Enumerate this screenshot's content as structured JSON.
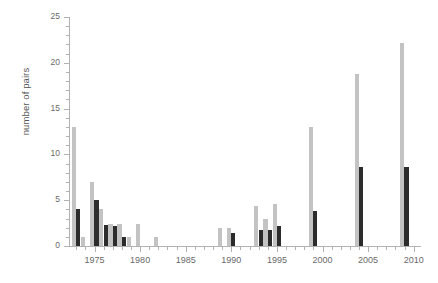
{
  "chart_data": {
    "type": "bar",
    "title": "",
    "subtitle": "",
    "xlabel": "",
    "ylabel": "number of pairs",
    "xlim": [
      1972.2,
      2010.8
    ],
    "ylim": [
      0,
      25
    ],
    "yticks": [
      0,
      5,
      10,
      15,
      20,
      25
    ],
    "ytick_labels": [
      "0",
      "5",
      "10",
      "15",
      "20",
      "25"
    ],
    "y_minor_tick_step": 1,
    "xticks": [
      1975,
      1980,
      1985,
      1990,
      1995,
      2000,
      2005,
      2010
    ],
    "xtick_labels": [
      "1975",
      "1980",
      "1985",
      "1990",
      "1995",
      "2000",
      "2005",
      "2010"
    ],
    "x_minor_tick_step": 1,
    "grid": false,
    "legend": "none",
    "colors": {
      "series_light": "#c3c3c3",
      "series_dark": "#2c2c2c",
      "axis": "#b2b2b2",
      "text": "#6a6a6a",
      "background": "#ffffff"
    },
    "series": [
      {
        "name": "light",
        "color": "#c3c3c3",
        "points": [
          {
            "x": 1973,
            "y": 13
          },
          {
            "x": 1974,
            "y": 1
          },
          {
            "x": 1975,
            "y": 7
          },
          {
            "x": 1976,
            "y": 4
          },
          {
            "x": 1977,
            "y": 2.4
          },
          {
            "x": 1978,
            "y": 2.4
          },
          {
            "x": 1979,
            "y": 1
          },
          {
            "x": 1980,
            "y": 2.4
          },
          {
            "x": 1982,
            "y": 1
          },
          {
            "x": 1989,
            "y": 2
          },
          {
            "x": 1990,
            "y": 2
          },
          {
            "x": 1993,
            "y": 4.4
          },
          {
            "x": 1994,
            "y": 3
          },
          {
            "x": 1995,
            "y": 4.6
          },
          {
            "x": 1999,
            "y": 13
          },
          {
            "x": 2004,
            "y": 18.8
          },
          {
            "x": 2009,
            "y": 22.2
          }
        ]
      },
      {
        "name": "dark",
        "color": "#2c2c2c",
        "points": [
          {
            "x": 1973,
            "y": 4
          },
          {
            "x": 1975,
            "y": 5
          },
          {
            "x": 1976,
            "y": 2.3
          },
          {
            "x": 1977,
            "y": 2.2
          },
          {
            "x": 1978,
            "y": 1
          },
          {
            "x": 1990,
            "y": 1.4
          },
          {
            "x": 1993,
            "y": 1.8
          },
          {
            "x": 1994,
            "y": 1.8
          },
          {
            "x": 1995,
            "y": 2.2
          },
          {
            "x": 1999,
            "y": 3.8
          },
          {
            "x": 2004,
            "y": 8.6
          },
          {
            "x": 2009,
            "y": 8.6
          }
        ]
      }
    ]
  }
}
